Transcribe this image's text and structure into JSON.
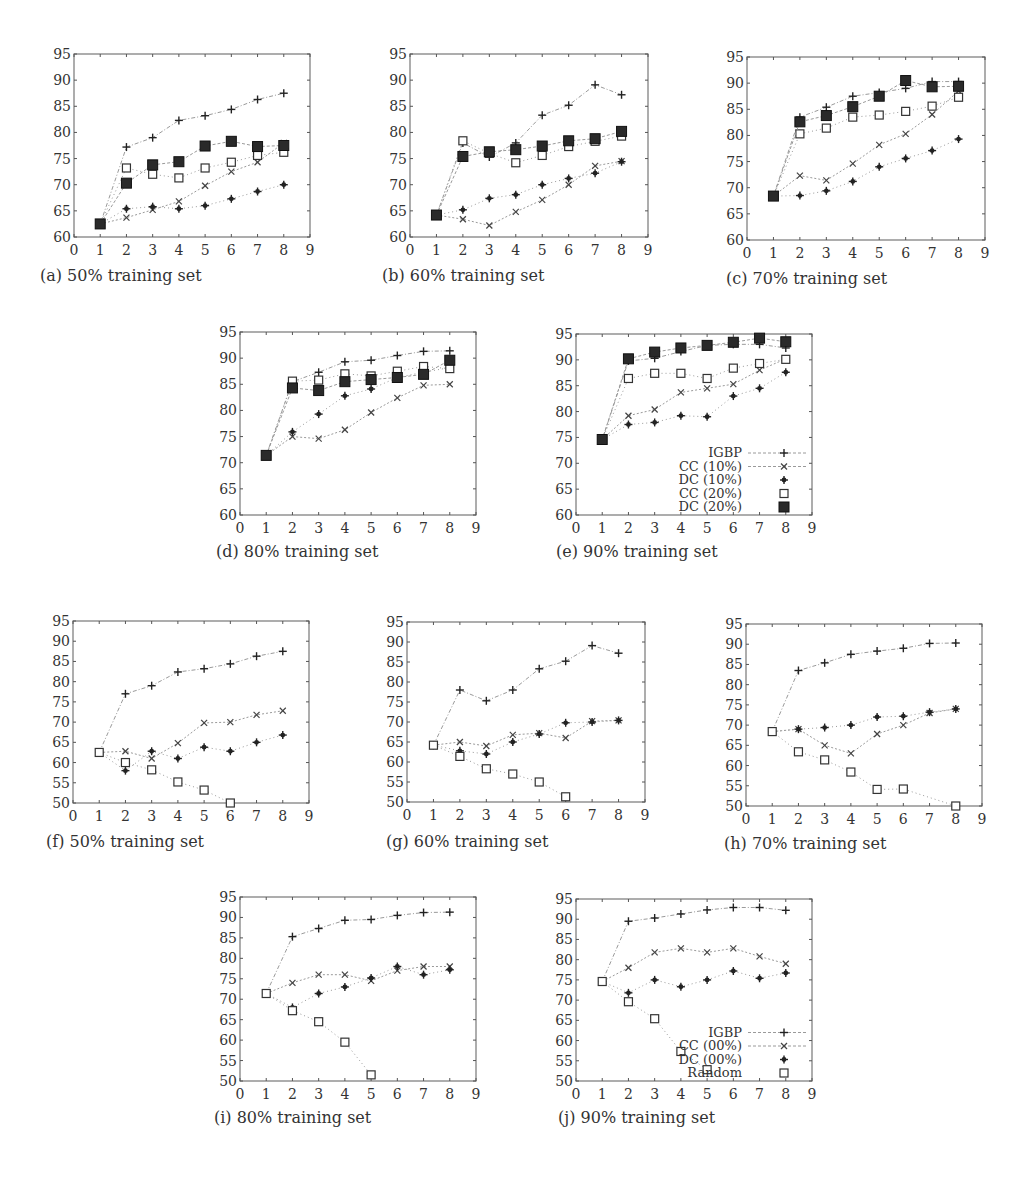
{
  "chart_data": [
    {
      "id": "a",
      "type": "line",
      "caption": "(a) 50% training set",
      "xlim": [
        0,
        9
      ],
      "ylim": [
        60,
        95
      ],
      "xticks": [
        0,
        1,
        2,
        3,
        4,
        5,
        6,
        7,
        8,
        9
      ],
      "yticks": [
        60,
        65,
        70,
        75,
        80,
        85,
        90,
        95
      ],
      "x": [
        1,
        2,
        3,
        4,
        5,
        6,
        7,
        8
      ],
      "series": [
        {
          "name": "IGBP",
          "marker": "plus",
          "values": [
            62.5,
            77.2,
            79.0,
            82.3,
            83.2,
            84.4,
            86.3,
            87.5
          ]
        },
        {
          "name": "CC (10%)",
          "marker": "x",
          "values": [
            62.5,
            63.7,
            65.2,
            66.8,
            69.8,
            72.5,
            74.3,
            78.0
          ]
        },
        {
          "name": "DC (10%)",
          "marker": "star",
          "values": [
            62.5,
            65.4,
            65.8,
            65.4,
            66.0,
            67.3,
            68.7,
            70.0
          ]
        },
        {
          "name": "CC (20%)",
          "marker": "square-open",
          "values": [
            62.5,
            73.2,
            72.0,
            71.3,
            73.2,
            74.3,
            75.6,
            76.2
          ]
        },
        {
          "name": "DC (20%)",
          "marker": "square-filled",
          "values": [
            62.5,
            70.3,
            73.8,
            74.4,
            77.4,
            78.3,
            77.3,
            77.5
          ]
        }
      ]
    },
    {
      "id": "b",
      "type": "line",
      "caption": "(b) 60% training set",
      "xlim": [
        0,
        9
      ],
      "ylim": [
        60,
        95
      ],
      "xticks": [
        0,
        1,
        2,
        3,
        4,
        5,
        6,
        7,
        8,
        9
      ],
      "yticks": [
        60,
        65,
        70,
        75,
        80,
        85,
        90,
        95
      ],
      "x": [
        1,
        2,
        3,
        4,
        5,
        6,
        7,
        8
      ],
      "series": [
        {
          "name": "IGBP",
          "marker": "plus",
          "values": [
            64.2,
            78.0,
            75.3,
            78.0,
            83.3,
            85.2,
            89.1,
            87.2
          ]
        },
        {
          "name": "CC (10%)",
          "marker": "x",
          "values": [
            64.2,
            63.4,
            62.2,
            64.8,
            67.1,
            70.0,
            73.6,
            74.5
          ]
        },
        {
          "name": "DC (10%)",
          "marker": "star",
          "values": [
            64.2,
            65.2,
            67.4,
            68.1,
            70.0,
            71.2,
            72.2,
            74.4
          ]
        },
        {
          "name": "CC (20%)",
          "marker": "square-open",
          "values": [
            64.2,
            78.4,
            76.0,
            74.2,
            75.6,
            77.3,
            78.3,
            79.3
          ]
        },
        {
          "name": "DC (20%)",
          "marker": "square-filled",
          "values": [
            64.2,
            75.4,
            76.3,
            76.7,
            77.4,
            78.4,
            78.8,
            80.2
          ]
        }
      ]
    },
    {
      "id": "c",
      "type": "line",
      "caption": "(c) 70% training set",
      "xlim": [
        0,
        9
      ],
      "ylim": [
        60,
        95
      ],
      "xticks": [
        0,
        1,
        2,
        3,
        4,
        5,
        6,
        7,
        8,
        9
      ],
      "yticks": [
        60,
        65,
        70,
        75,
        80,
        85,
        90,
        95
      ],
      "x": [
        1,
        2,
        3,
        4,
        5,
        6,
        7,
        8
      ],
      "series": [
        {
          "name": "IGBP",
          "marker": "plus",
          "values": [
            68.4,
            83.5,
            85.4,
            87.5,
            88.2,
            89.0,
            90.3,
            90.3
          ]
        },
        {
          "name": "CC (10%)",
          "marker": "x",
          "values": [
            68.4,
            72.3,
            71.4,
            74.6,
            78.2,
            80.3,
            84.0,
            88.5
          ]
        },
        {
          "name": "DC (10%)",
          "marker": "star",
          "values": [
            68.4,
            68.5,
            69.4,
            71.2,
            74.0,
            75.6,
            77.1,
            79.3
          ]
        },
        {
          "name": "CC (20%)",
          "marker": "square-open",
          "values": [
            68.4,
            80.3,
            81.4,
            83.5,
            83.9,
            84.6,
            85.6,
            87.3
          ]
        },
        {
          "name": "DC (20%)",
          "marker": "square-filled",
          "values": [
            68.4,
            82.6,
            83.8,
            85.5,
            87.5,
            90.5,
            89.3,
            89.4
          ]
        }
      ]
    },
    {
      "id": "d",
      "type": "line",
      "caption": "(d) 80% training set",
      "xlim": [
        0,
        9
      ],
      "ylim": [
        60,
        95
      ],
      "xticks": [
        0,
        1,
        2,
        3,
        4,
        5,
        6,
        7,
        8,
        9
      ],
      "yticks": [
        60,
        65,
        70,
        75,
        80,
        85,
        90,
        95
      ],
      "x": [
        1,
        2,
        3,
        4,
        5,
        6,
        7,
        8
      ],
      "series": [
        {
          "name": "IGBP",
          "marker": "plus",
          "values": [
            71.4,
            85.5,
            87.3,
            89.3,
            89.6,
            90.5,
            91.3,
            91.4
          ]
        },
        {
          "name": "CC (10%)",
          "marker": "x",
          "values": [
            71.4,
            75.0,
            74.6,
            76.3,
            79.6,
            82.4,
            84.8,
            85.0
          ]
        },
        {
          "name": "DC (10%)",
          "marker": "star",
          "values": [
            71.4,
            75.9,
            79.3,
            82.8,
            84.1,
            86.3,
            87.3,
            88.2
          ]
        },
        {
          "name": "CC (20%)",
          "marker": "square-open",
          "values": [
            71.4,
            85.6,
            85.8,
            87.0,
            86.6,
            87.5,
            88.4,
            88.0
          ]
        },
        {
          "name": "DC (20%)",
          "marker": "square-filled",
          "values": [
            71.4,
            84.3,
            83.8,
            85.5,
            85.9,
            86.3,
            86.9,
            89.6
          ]
        }
      ]
    },
    {
      "id": "e",
      "type": "line",
      "caption": "(e) 90% training set",
      "xlim": [
        0,
        9
      ],
      "ylim": [
        60,
        95
      ],
      "xticks": [
        0,
        1,
        2,
        3,
        4,
        5,
        6,
        7,
        8,
        9
      ],
      "yticks": [
        60,
        65,
        70,
        75,
        80,
        85,
        90,
        95
      ],
      "x": [
        1,
        2,
        3,
        4,
        5,
        6,
        7,
        8
      ],
      "legend": {
        "position": "lower-right",
        "entries": [
          "IGBP",
          "CC (10%)",
          "DC (10%)",
          "CC (20%)",
          "DC (20%)"
        ]
      },
      "series": [
        {
          "name": "IGBP",
          "marker": "plus",
          "values": [
            74.6,
            89.8,
            90.3,
            91.6,
            92.8,
            93.0,
            93.0,
            92.3
          ]
        },
        {
          "name": "CC (10%)",
          "marker": "x",
          "values": [
            74.6,
            79.2,
            80.4,
            83.7,
            84.5,
            85.3,
            88.0,
            90.2
          ]
        },
        {
          "name": "DC (10%)",
          "marker": "star",
          "values": [
            74.6,
            77.5,
            77.9,
            79.2,
            79.0,
            83.0,
            84.5,
            87.6
          ]
        },
        {
          "name": "CC (20%)",
          "marker": "square-open",
          "values": [
            74.6,
            86.4,
            87.4,
            87.4,
            86.4,
            88.4,
            89.3,
            90.1
          ]
        },
        {
          "name": "DC (20%)",
          "marker": "square-filled",
          "values": [
            74.6,
            90.2,
            91.5,
            92.3,
            92.8,
            93.4,
            94.2,
            93.5
          ]
        }
      ]
    },
    {
      "id": "f",
      "type": "line",
      "caption": "(f) 50% training set",
      "xlim": [
        0,
        9
      ],
      "ylim": [
        50,
        95
      ],
      "xticks": [
        0,
        1,
        2,
        3,
        4,
        5,
        6,
        7,
        8,
        9
      ],
      "yticks": [
        50,
        55,
        60,
        65,
        70,
        75,
        80,
        85,
        90,
        95
      ],
      "x": [
        1,
        2,
        3,
        4,
        5,
        6,
        7,
        8
      ],
      "series": [
        {
          "name": "IGBP",
          "marker": "plus",
          "values": [
            62.5,
            77.0,
            79.0,
            82.4,
            83.2,
            84.4,
            86.3,
            87.5
          ]
        },
        {
          "name": "CC (00%)",
          "marker": "x",
          "values": [
            62.5,
            62.8,
            61.0,
            64.8,
            69.8,
            70.0,
            71.8,
            72.8
          ]
        },
        {
          "name": "DC (00%)",
          "marker": "star",
          "values": [
            62.5,
            58.0,
            62.8,
            61.0,
            63.8,
            62.8,
            65.0,
            66.8
          ]
        },
        {
          "name": "Random",
          "marker": "square-open",
          "values": [
            62.5,
            60.0,
            58.2,
            55.2,
            53.2,
            50.0,
            null,
            null
          ]
        }
      ]
    },
    {
      "id": "g",
      "type": "line",
      "caption": "(g) 60% training set",
      "xlim": [
        0,
        9
      ],
      "ylim": [
        50,
        95
      ],
      "xticks": [
        0,
        1,
        2,
        3,
        4,
        5,
        6,
        7,
        8,
        9
      ],
      "yticks": [
        50,
        55,
        60,
        65,
        70,
        75,
        80,
        85,
        90,
        95
      ],
      "x": [
        1,
        2,
        3,
        4,
        5,
        6,
        7,
        8
      ],
      "series": [
        {
          "name": "IGBP",
          "marker": "plus",
          "values": [
            64.2,
            78.0,
            75.3,
            78.0,
            83.3,
            85.2,
            89.1,
            87.2
          ]
        },
        {
          "name": "CC (00%)",
          "marker": "x",
          "values": [
            64.2,
            65.0,
            64.0,
            66.8,
            67.2,
            66.0,
            70.2,
            70.4
          ]
        },
        {
          "name": "DC (00%)",
          "marker": "star",
          "values": [
            64.2,
            62.8,
            62.0,
            65.0,
            67.0,
            69.8,
            70.0,
            70.4
          ]
        },
        {
          "name": "Random",
          "marker": "square-open",
          "values": [
            64.2,
            61.4,
            58.3,
            57.0,
            55.0,
            51.3,
            null,
            null
          ]
        }
      ]
    },
    {
      "id": "h",
      "type": "line",
      "caption": "(h) 70% training set",
      "xlim": [
        0,
        9
      ],
      "ylim": [
        50,
        95
      ],
      "xticks": [
        0,
        1,
        2,
        3,
        4,
        5,
        6,
        7,
        8,
        9
      ],
      "yticks": [
        50,
        55,
        60,
        65,
        70,
        75,
        80,
        85,
        90,
        95
      ],
      "x": [
        1,
        2,
        3,
        4,
        5,
        6,
        7,
        8
      ],
      "series": [
        {
          "name": "IGBP",
          "marker": "plus",
          "values": [
            68.4,
            83.5,
            85.4,
            87.5,
            88.3,
            89.0,
            90.2,
            90.3
          ]
        },
        {
          "name": "CC (00%)",
          "marker": "x",
          "values": [
            68.4,
            69.0,
            65.0,
            63.0,
            67.8,
            70.0,
            73.0,
            74.0
          ]
        },
        {
          "name": "DC (00%)",
          "marker": "star",
          "values": [
            68.4,
            69.0,
            69.4,
            70.0,
            72.0,
            72.2,
            73.2,
            74.0
          ]
        },
        {
          "name": "Random",
          "marker": "square-open",
          "values": [
            68.4,
            63.4,
            61.4,
            58.4,
            54.1,
            54.2,
            null,
            50.0
          ]
        }
      ]
    },
    {
      "id": "i",
      "type": "line",
      "caption": "(i) 80% training set",
      "xlim": [
        0,
        9
      ],
      "ylim": [
        50,
        95
      ],
      "xticks": [
        0,
        1,
        2,
        3,
        4,
        5,
        6,
        7,
        8,
        9
      ],
      "yticks": [
        50,
        55,
        60,
        65,
        70,
        75,
        80,
        85,
        90,
        95
      ],
      "x": [
        1,
        2,
        3,
        4,
        5,
        6,
        7,
        8
      ],
      "series": [
        {
          "name": "IGBP",
          "marker": "plus",
          "values": [
            71.4,
            85.3,
            87.3,
            89.3,
            89.5,
            90.5,
            91.2,
            91.3
          ]
        },
        {
          "name": "CC (00%)",
          "marker": "x",
          "values": [
            71.4,
            74.0,
            76.0,
            76.0,
            74.5,
            77.0,
            78.0,
            78.0
          ]
        },
        {
          "name": "DC (00%)",
          "marker": "star",
          "values": [
            71.4,
            68.0,
            71.4,
            73.0,
            75.2,
            78.0,
            76.0,
            77.2
          ]
        },
        {
          "name": "Random",
          "marker": "square-open",
          "values": [
            71.4,
            67.2,
            64.5,
            59.5,
            51.5,
            null,
            null,
            null
          ]
        }
      ]
    },
    {
      "id": "j",
      "type": "line",
      "caption": "(j) 90% training set",
      "xlim": [
        0,
        9
      ],
      "ylim": [
        50,
        95
      ],
      "xticks": [
        0,
        1,
        2,
        3,
        4,
        5,
        6,
        7,
        8,
        9
      ],
      "yticks": [
        50,
        55,
        60,
        65,
        70,
        75,
        80,
        85,
        90,
        95
      ],
      "x": [
        1,
        2,
        3,
        4,
        5,
        6,
        7,
        8
      ],
      "legend": {
        "position": "lower-right",
        "entries": [
          "IGBP",
          "CC (00%)",
          "DC (00%)",
          "Random"
        ]
      },
      "series": [
        {
          "name": "IGBP",
          "marker": "plus",
          "values": [
            74.6,
            89.5,
            90.3,
            91.3,
            92.3,
            92.9,
            92.9,
            92.2
          ]
        },
        {
          "name": "CC (00%)",
          "marker": "x",
          "values": [
            74.6,
            78.0,
            81.8,
            82.8,
            81.8,
            82.8,
            80.8,
            79.0
          ]
        },
        {
          "name": "DC (00%)",
          "marker": "star",
          "values": [
            74.6,
            71.8,
            75.0,
            73.3,
            75.0,
            77.2,
            75.4,
            76.7
          ]
        },
        {
          "name": "Random",
          "marker": "square-open",
          "values": [
            74.6,
            69.6,
            65.4,
            57.3,
            52.8,
            null,
            null,
            null
          ]
        }
      ]
    }
  ],
  "layout": {
    "panels": [
      {
        "id": "a",
        "left": 74,
        "top": 54,
        "w": 236,
        "h": 183,
        "cap_x": 40,
        "cap_y": 280
      },
      {
        "id": "b",
        "left": 410,
        "top": 54,
        "w": 238,
        "h": 183,
        "cap_x": 382,
        "cap_y": 280
      },
      {
        "id": "c",
        "left": 747,
        "top": 57,
        "w": 238,
        "h": 183,
        "cap_x": 726,
        "cap_y": 283
      },
      {
        "id": "d",
        "left": 240,
        "top": 332,
        "w": 236,
        "h": 183,
        "cap_x": 216,
        "cap_y": 556
      },
      {
        "id": "e",
        "left": 576,
        "top": 334,
        "w": 236,
        "h": 181,
        "cap_x": 556,
        "cap_y": 556
      },
      {
        "id": "f",
        "left": 73,
        "top": 621,
        "w": 236,
        "h": 182,
        "cap_x": 46,
        "cap_y": 846
      },
      {
        "id": "g",
        "left": 407,
        "top": 622,
        "w": 238,
        "h": 180,
        "cap_x": 386,
        "cap_y": 846
      },
      {
        "id": "h",
        "left": 746,
        "top": 624,
        "w": 236,
        "h": 182,
        "cap_x": 724,
        "cap_y": 848
      },
      {
        "id": "i",
        "left": 240,
        "top": 897,
        "w": 236,
        "h": 184,
        "cap_x": 214,
        "cap_y": 1122
      },
      {
        "id": "j",
        "left": 576,
        "top": 899,
        "w": 236,
        "h": 182,
        "cap_x": 558,
        "cap_y": 1122
      }
    ]
  }
}
